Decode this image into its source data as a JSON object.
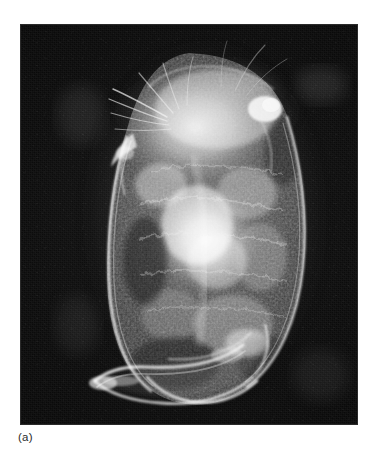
{
  "figure": {
    "label": "(a)",
    "caption_position": "below-left",
    "plate": {
      "kind": "photomicrograph",
      "technique": "dark-field",
      "subject": "water flea (cladoceran / Daphnia) whole mount, lateral view",
      "background_color": "#0a0a0a",
      "specimen_highlight_color": "#f2f2f2",
      "frame_border_color": "#2a2a2a",
      "frame": {
        "x": 21,
        "y": 25,
        "width": 336,
        "height": 399
      }
    },
    "structures": [
      {
        "name": "carapace",
        "description": "large oval bivalved shell enclosing the body",
        "brightness": "bright rim, mottled interior"
      },
      {
        "name": "head-region",
        "description": "upper mass with granular bright texture",
        "brightness": "very bright"
      },
      {
        "name": "antennal-setae",
        "description": "fine hair-like filaments radiating from upper-left",
        "brightness": "faint bright streaks"
      },
      {
        "name": "rostrum",
        "description": "pointed projection on the left margin below the head",
        "brightness": "bright edge"
      },
      {
        "name": "brood-chamber",
        "description": "bright granular mass in the central body cavity",
        "brightness": "brightest region"
      },
      {
        "name": "post-abdomen",
        "description": "curved tail-like process extending to the lower left",
        "brightness": "bright outline"
      },
      {
        "name": "shell-spine",
        "description": "lower curved margin of the carapace",
        "brightness": "bright crescent"
      }
    ]
  }
}
